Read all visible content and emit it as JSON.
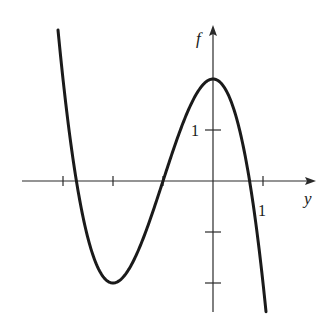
{
  "chart_data": {
    "type": "line",
    "title": "",
    "xlabel": "y",
    "ylabel": "f",
    "function": "f(y) = -y^3 - 3y^2 + 2",
    "x_ticks": [
      -3,
      -2,
      -1,
      0,
      1
    ],
    "x_tick_labels": [
      {
        "value": 1,
        "label": "1"
      }
    ],
    "y_ticks": [
      -2,
      -1,
      1
    ],
    "y_tick_labels": [
      {
        "value": 1,
        "label": "1"
      }
    ],
    "xlim": [
      -3.0,
      2.05
    ],
    "ylim": [
      -2.6,
      3.05
    ],
    "grid": false,
    "series": [
      {
        "name": "f",
        "x": [
          -3.1,
          -3.0,
          -2.732,
          -2.5,
          -2.0,
          -1.5,
          -1.0,
          -0.5,
          0.0,
          0.5,
          0.732,
          1.0,
          1.06
        ],
        "values": [
          2.96,
          2.0,
          0.0,
          -1.125,
          -2.0,
          -1.375,
          0.0,
          1.375,
          2.0,
          1.125,
          0.0,
          -2.0,
          -2.56
        ]
      }
    ],
    "key_points": {
      "local_max": {
        "y": 0,
        "f": 2
      },
      "local_min": {
        "y": -2,
        "f": -2
      },
      "zeros": [
        -2.732,
        -1,
        0.732
      ]
    }
  },
  "labels": {
    "x_axis": "y",
    "y_axis": "f",
    "x_tick_one": "1",
    "y_tick_one": "1"
  },
  "colors": {
    "curve": "#1a1a1a",
    "axis": "#2a2a2a",
    "background": "#ffffff"
  }
}
